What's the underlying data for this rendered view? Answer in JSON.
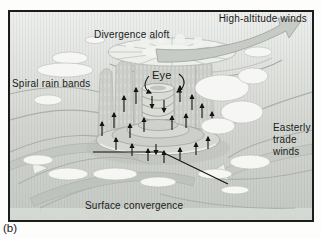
{
  "figure": {
    "caption": "(b)",
    "labels": {
      "high_altitude_winds": "High-altitude winds",
      "divergence_aloft": "Divergence aloft",
      "eye": "Eye",
      "spiral_rain_bands": "Spiral rain bands",
      "easterly_trade_winds": [
        "Easterly",
        "trade",
        "winds"
      ],
      "surface_convergence": "Surface convergence"
    },
    "colors": {
      "frame_border": "#1c1c1c",
      "background_top": "#edefed",
      "background_bottom": "#c5c9c3",
      "band_gray": "#c3c7c1",
      "cloud_white": "#f6f7f4",
      "cloud_outline": "#b7bbb5",
      "arrow_black": "#141414",
      "text": "#202020"
    }
  }
}
